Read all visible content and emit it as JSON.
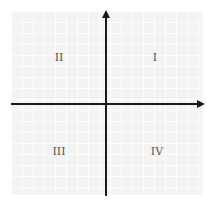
{
  "diagram": {
    "quadrants": [
      {
        "label": "I",
        "position": "upper-right"
      },
      {
        "label": "II",
        "position": "upper-left"
      },
      {
        "label": "III",
        "position": "lower-left"
      },
      {
        "label": "IV",
        "position": "lower-right"
      }
    ],
    "axes": {
      "x_arrow": "right",
      "y_arrow": "up"
    },
    "colors": {
      "axis": "#1a1a1a",
      "grid_background": "#f3f3f3",
      "grid_lines": "#fdfdfd",
      "label": "#555555"
    }
  }
}
